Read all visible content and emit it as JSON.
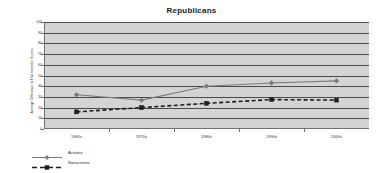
{
  "chart_data": {
    "type": "line",
    "title": "Republicans",
    "xlabel": "",
    "ylabel": "Average Difference in Thermometer Scores",
    "categories": [
      "1960s",
      "1970s",
      "1980s",
      "1990s",
      "2000s"
    ],
    "ylim": [
      0,
      100
    ],
    "ytick_labels": [
      "0",
      "10",
      "20",
      "30",
      "40",
      "50",
      "60",
      "70",
      "80",
      "90",
      "100"
    ],
    "ytick_values": [
      0,
      10,
      20,
      30,
      40,
      50,
      60,
      70,
      80,
      90,
      100
    ],
    "grid": "horizontal",
    "legend_position": "bottom-left",
    "plot_background": "#d4d4d4",
    "series": [
      {
        "name": "Activists",
        "values": [
          32,
          27,
          40,
          43,
          45
        ],
        "color": "#7a7a7a",
        "line_style": "solid",
        "marker": "diamond"
      },
      {
        "name": "Nonactivists",
        "values": [
          16,
          20,
          24,
          27.5,
          27
        ],
        "color": "#1e1e1e",
        "line_style": "dashed",
        "marker": "square"
      }
    ]
  }
}
